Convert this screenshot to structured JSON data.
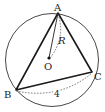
{
  "diagram": {
    "type": "circumscribed-circle-triangle",
    "points": {
      "A": {
        "label": "A",
        "x": 58,
        "y": 13
      },
      "B": {
        "label": "B",
        "x": 16,
        "y": 90
      },
      "C": {
        "label": "C",
        "x": 92,
        "y": 72
      },
      "O": {
        "label": "O",
        "x": 49,
        "y": 58
      }
    },
    "circle": {
      "cx": 52,
      "cy": 60,
      "r": 47
    },
    "labels": {
      "radius": "R",
      "side_bc": "4"
    },
    "colors": {
      "stroke": "#222222",
      "background": "#ffffff"
    }
  }
}
